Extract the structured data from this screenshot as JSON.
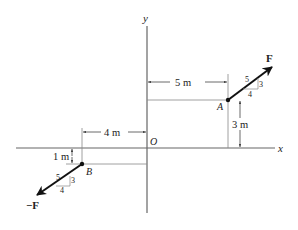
{
  "axes": {
    "x_label": "x",
    "y_label": "y",
    "origin_label": "O"
  },
  "points": {
    "A": {
      "label": "A"
    },
    "B": {
      "label": "B"
    }
  },
  "forces": {
    "F": {
      "label": "F",
      "slope_hyp": "5",
      "slope_rise": "3",
      "slope_run": "4"
    },
    "negF": {
      "label": "−F",
      "slope_hyp": "5",
      "slope_rise": "3",
      "slope_run": "4"
    }
  },
  "dimensions": {
    "A_x": "5 m",
    "A_y": "3 m",
    "B_x": "4 m",
    "B_y": "1 m"
  },
  "colors": {
    "line": "#555555",
    "arrow": "#111111",
    "text": "#222222"
  }
}
